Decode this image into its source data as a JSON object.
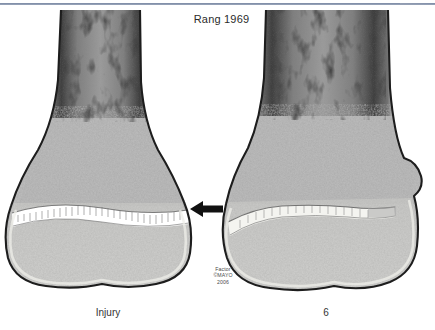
{
  "figure": {
    "title": "Rang 1969",
    "background_color": "#ffffff",
    "rule_color": "#6d7d99",
    "credit": {
      "line1": "Factor",
      "line2": "©MAYO",
      "line3": "2006"
    },
    "annotation": {
      "arrow_name": "left-pointing-arrow",
      "arrow_color": "#111111",
      "points_to": "growth plate of injured specimen"
    }
  },
  "specimens": [
    {
      "id": "injury",
      "caption": "Injury",
      "description": "Distal long bone with open physis (growth plate) shown as a bright white band; metaphyseal and epiphyseal trabecular bone visible; dense cortical margins.",
      "physis_state": "open",
      "cortex_color": "#1d1d1d",
      "marrow_color": "#8a8a8a",
      "physis_color": "#ffffff"
    },
    {
      "id": "6",
      "caption": "6",
      "description": "Same bone at follow-up; physis partially bridged/closing with a bony bar, and a bony prominence has formed along the lateral margin.",
      "physis_state": "partially bridged",
      "cortex_color": "#1d1d1d",
      "marrow_color": "#8a8a8a",
      "physis_color": "#f2f2ee"
    }
  ]
}
